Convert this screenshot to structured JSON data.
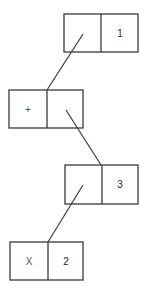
{
  "diagram": {
    "type": "cons-cell linked list",
    "cells": [
      {
        "id": "cell-1",
        "car": "",
        "cdr": "1",
        "car_is_pointer": true,
        "points_to": "cell-2"
      },
      {
        "id": "cell-2",
        "car": "+",
        "cdr": "",
        "cdr_is_pointer": true,
        "points_to": "cell-3"
      },
      {
        "id": "cell-3",
        "car": "",
        "cdr": "3",
        "car_is_pointer": true,
        "points_to": "cell-4"
      },
      {
        "id": "cell-4",
        "car": "X",
        "cdr": "2"
      }
    ],
    "colors": {
      "stroke": "#3a3a3a",
      "text": "#2a2a2a",
      "background": "#ffffff"
    }
  }
}
